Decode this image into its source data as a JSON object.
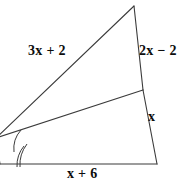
{
  "figure": {
    "kind": "geometry-diagram",
    "background_color": "#ffffff",
    "stroke_color": "#3b3b3b",
    "text_color": "#0d0d0d",
    "stroke_width": 1
  },
  "labels": {
    "hypotenuse": "3x + 2",
    "upper_right": "2x − 2",
    "lower_right": "x",
    "base": "x + 6"
  },
  "vertices": {
    "apex": {
      "x": 134,
      "y": 6
    },
    "cevian_foot": {
      "x": 143,
      "y": 90
    },
    "bottom_right": {
      "x": 157,
      "y": 164
    },
    "left": {
      "x": -4,
      "y": 138
    },
    "base_left": {
      "x": 0,
      "y": 164
    }
  },
  "angle_marks": {
    "upper_arc_count": 1,
    "lower_arc_count": 2,
    "meaning": "congruent angles (angle bisector)"
  }
}
